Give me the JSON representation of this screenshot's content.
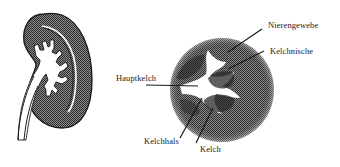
{
  "diagram": {
    "kidney_overview": {
      "description": "Kidney cross-section with ureter and branching calyx system"
    },
    "detail_view": {
      "description": "Enlarged circular section of kidney calyx system"
    },
    "labels": {
      "nierengewebe": "Nierengewebe",
      "kelchnische": "Kelchnische",
      "hauptkelch": "Hauptkelch",
      "kelchhals": "Kelchhals",
      "kelch": "Kelch"
    },
    "colors": {
      "tissue": "#5a5a5a",
      "outline": "#1a1a1a",
      "background": "#ffffff"
    }
  }
}
